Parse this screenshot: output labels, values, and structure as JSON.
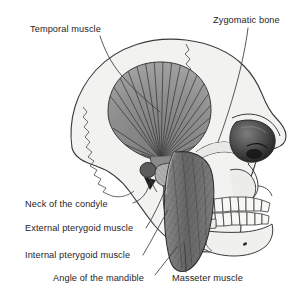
{
  "figure": {
    "background_color": "#ffffff",
    "line_color": "#3a3a3a",
    "bone_fill": "#f2f2f0",
    "temporal_muscle_fill": "#8e8e8e",
    "masseter_muscle_fill": "#6f6f6f",
    "pterygoid_fill": "#a8a8a8",
    "orbit_fill": "#4a4a4a",
    "label_color": "#252525"
  },
  "labels": {
    "temporal_muscle": "Temporal muscle",
    "zygomatic_bone": "Zygomatic bone",
    "neck_of_the_condyle": "Neck of the condyle",
    "external_pterygoid_muscle": "External pterygoid muscle",
    "internal_pterygoid_muscle": "Internal pterygoid muscle",
    "angle_of_the_mandible": "Angle of the mandible",
    "masseter_muscle": "Masseter muscle"
  },
  "structures": [
    {
      "name": "cranium",
      "type": "bone"
    },
    {
      "name": "coronal-suture",
      "type": "suture"
    },
    {
      "name": "squamous-suture",
      "type": "suture"
    },
    {
      "name": "temporal-muscle",
      "type": "muscle",
      "shading": "radiating-striations"
    },
    {
      "name": "zygomatic-arch",
      "type": "bone"
    },
    {
      "name": "orbit",
      "type": "cavity"
    },
    {
      "name": "nasal-aperture",
      "type": "cavity"
    },
    {
      "name": "maxilla",
      "type": "bone"
    },
    {
      "name": "upper-teeth",
      "type": "bone",
      "count": 8
    },
    {
      "name": "lower-teeth",
      "type": "bone",
      "count": 8
    },
    {
      "name": "mandible",
      "type": "bone"
    },
    {
      "name": "condyle",
      "type": "bone"
    },
    {
      "name": "masseter-muscle",
      "type": "muscle",
      "shading": "cross-hatched"
    },
    {
      "name": "external-pterygoid-muscle",
      "type": "muscle"
    },
    {
      "name": "internal-pterygoid-muscle",
      "type": "muscle"
    }
  ]
}
